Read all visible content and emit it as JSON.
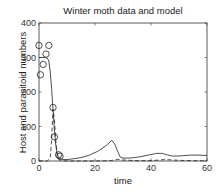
{
  "chart_data": {
    "type": "line",
    "title": "Winter moth data and model",
    "xlabel": "time",
    "ylabel": "Host and parasitoid numbers",
    "xlim": [
      0,
      60
    ],
    "ylim": [
      0,
      400
    ],
    "xticks": [
      0,
      20,
      40,
      60
    ],
    "yticks": [
      0,
      100,
      200,
      300,
      400
    ],
    "grid": false,
    "legend": null,
    "series": [
      {
        "name": "Host (model)",
        "style": "solid",
        "x": [
          0,
          1,
          2,
          3,
          3.5,
          4,
          4.5,
          5,
          5.5,
          6,
          6.5,
          7,
          8,
          10,
          12,
          15,
          18,
          21,
          24,
          26,
          27,
          28,
          29,
          30,
          33,
          36,
          39,
          42,
          44,
          46,
          48,
          51,
          54,
          57,
          60
        ],
        "y": [
          300,
          300,
          300,
          298,
          290,
          260,
          210,
          150,
          90,
          45,
          20,
          10,
          5,
          4,
          6,
          10,
          17,
          28,
          45,
          60,
          50,
          30,
          12,
          8,
          9,
          12,
          17,
          22,
          22,
          17,
          14,
          15,
          17,
          17,
          16
        ]
      },
      {
        "name": "Parasitoid (model)",
        "style": "dashed",
        "x": [
          0,
          3,
          4,
          4.5,
          5,
          5.5,
          6,
          6.5,
          7,
          8,
          10,
          15,
          20,
          25,
          27,
          28,
          30,
          35,
          40,
          43,
          45,
          50,
          55,
          60
        ],
        "y": [
          0,
          0,
          10,
          60,
          150,
          120,
          60,
          20,
          5,
          1,
          0,
          0,
          0,
          1,
          3,
          5,
          3,
          1,
          1,
          3,
          4,
          2,
          1,
          1
        ]
      },
      {
        "name": "Data",
        "style": "circles",
        "x": [
          0,
          0.5,
          1.5,
          2.5,
          3.5,
          5,
          5.5,
          7,
          7.5
        ],
        "y": [
          335,
          250,
          280,
          310,
          335,
          155,
          70,
          18,
          14
        ]
      }
    ]
  }
}
